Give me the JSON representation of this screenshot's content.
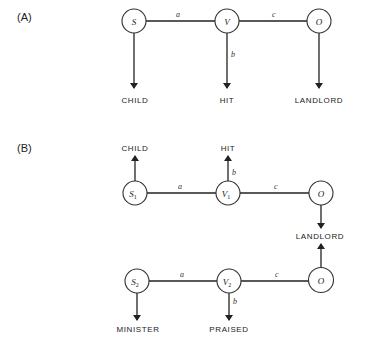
{
  "panels": [
    {
      "id": "A",
      "label": "(A)",
      "nodes": [
        {
          "id": "S",
          "text": "S",
          "sub": ""
        },
        {
          "id": "V",
          "text": "V",
          "sub": ""
        },
        {
          "id": "O",
          "text": "O",
          "sub": ""
        }
      ],
      "edges": [
        {
          "from": "S",
          "to": "V",
          "label": "a"
        },
        {
          "from": "V",
          "to": "O",
          "label": "c"
        }
      ],
      "arrows": [
        {
          "from": "S",
          "to": "CHILD",
          "label": ""
        },
        {
          "from": "V",
          "to": "HIT",
          "label": "b"
        },
        {
          "from": "O",
          "to": "LANDLORD",
          "label": ""
        }
      ],
      "concepts": [
        "CHILD",
        "HIT",
        "LANDLORD"
      ]
    },
    {
      "id": "B",
      "label": "(B)",
      "rows": [
        {
          "nodes": [
            {
              "id": "S1",
              "text": "S",
              "sub": "1"
            },
            {
              "id": "V1",
              "text": "V",
              "sub": "1"
            },
            {
              "id": "O",
              "text": "O",
              "sub": ""
            }
          ],
          "edges": [
            {
              "from": "S1",
              "to": "V1",
              "label": "a"
            },
            {
              "from": "V1",
              "to": "O",
              "label": "c"
            }
          ],
          "arrows": [
            {
              "from": "S1",
              "to": "CHILD",
              "label": ""
            },
            {
              "from": "V1",
              "to": "HIT",
              "label": "b"
            },
            {
              "from": "O",
              "to": "LANDLORD",
              "label": ""
            }
          ],
          "concepts": [
            "CHILD",
            "HIT"
          ]
        },
        {
          "nodes": [
            {
              "id": "S2",
              "text": "S",
              "sub": "2"
            },
            {
              "id": "V2",
              "text": "V",
              "sub": "2"
            },
            {
              "id": "O",
              "text": "O",
              "sub": ""
            }
          ],
          "edges": [
            {
              "from": "S2",
              "to": "V2",
              "label": "a"
            },
            {
              "from": "V2",
              "to": "O",
              "label": "c"
            }
          ],
          "arrows": [
            {
              "from": "S2",
              "to": "MINISTER",
              "label": ""
            },
            {
              "from": "V2",
              "to": "PRAISED",
              "label": "b"
            },
            {
              "from": "O",
              "to": "LANDLORD",
              "label": ""
            }
          ],
          "concepts": [
            "MINISTER",
            "PRAISED"
          ]
        }
      ],
      "shared_concept": "LANDLORD"
    }
  ]
}
